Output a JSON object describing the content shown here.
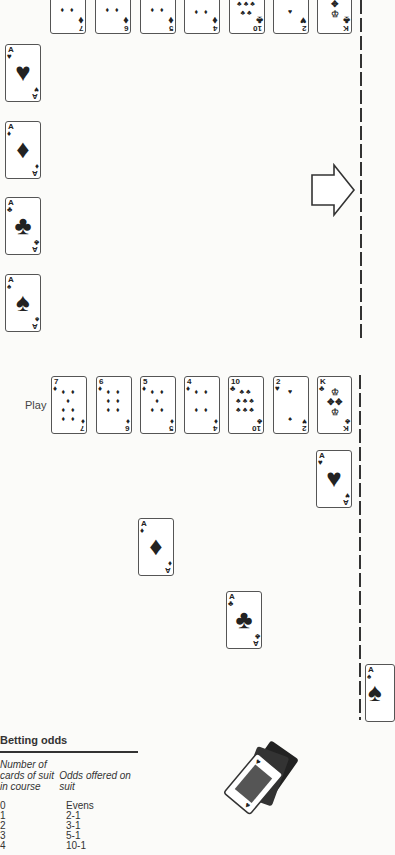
{
  "top_row": [
    {
      "rank": "7",
      "suit": "♦"
    },
    {
      "rank": "6",
      "suit": "♦"
    },
    {
      "rank": "5",
      "suit": "♦"
    },
    {
      "rank": "4",
      "suit": "♦"
    },
    {
      "rank": "10",
      "suit": "♣"
    },
    {
      "rank": "2",
      "suit": "♥"
    },
    {
      "rank": "K",
      "suit": "♣"
    }
  ],
  "aces_column": [
    {
      "rank": "A",
      "suit": "♥"
    },
    {
      "rank": "A",
      "suit": "♦"
    },
    {
      "rank": "A",
      "suit": "♣"
    },
    {
      "rank": "A",
      "suit": "♠"
    }
  ],
  "play_label": "Play",
  "play_row": [
    {
      "rank": "7",
      "suit": "♦"
    },
    {
      "rank": "6",
      "suit": "♦"
    },
    {
      "rank": "5",
      "suit": "♦"
    },
    {
      "rank": "4",
      "suit": "♦"
    },
    {
      "rank": "10",
      "suit": "♣"
    },
    {
      "rank": "2",
      "suit": "♥"
    },
    {
      "rank": "K",
      "suit": "♣"
    }
  ],
  "advanced_aces": [
    {
      "rank": "A",
      "suit": "♥"
    },
    {
      "rank": "A",
      "suit": "♦"
    },
    {
      "rank": "A",
      "suit": "♣"
    },
    {
      "rank": "A",
      "suit": "♠"
    }
  ],
  "betting_odds": {
    "title": "Betting odds",
    "header_col1": "Number of cards of suit in course",
    "header_col2": "Odds offered on suit",
    "rows": [
      {
        "count": "0",
        "odds": "Evens"
      },
      {
        "count": "1",
        "odds": "2-1"
      },
      {
        "count": "2",
        "odds": "3-1"
      },
      {
        "count": "3",
        "odds": "5-1"
      },
      {
        "count": "4",
        "odds": "10-1"
      }
    ]
  }
}
